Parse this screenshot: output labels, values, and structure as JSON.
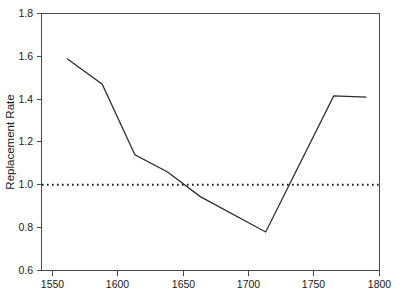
{
  "chart_data": {
    "type": "line",
    "title": "",
    "xlabel": "",
    "ylabel": "Replacement Rate",
    "xlim": [
      1540,
      1800
    ],
    "ylim": [
      0.6,
      1.8
    ],
    "xticks": [
      1550,
      1600,
      1650,
      1700,
      1750,
      1800
    ],
    "xtick_labels": [
      "1550",
      "1600",
      "1650",
      "1700",
      "1750",
      "1800"
    ],
    "yticks": [
      0.6,
      0.8,
      1.0,
      1.2,
      1.4,
      1.6,
      1.8
    ],
    "ytick_labels": [
      "0.6",
      "0.8",
      "1.0",
      "1.2",
      "1.4",
      "1.6",
      "1.8"
    ],
    "grid": false,
    "legend": "none",
    "series": [
      {
        "name": "Replacement Rate",
        "style": "solid",
        "color": "#2b2b2b",
        "x": [
          1561,
          1588,
          1613,
          1638,
          1663,
          1713,
          1765,
          1790
        ],
        "values": [
          1.59,
          1.47,
          1.14,
          1.06,
          0.945,
          0.78,
          1.415,
          1.41
        ]
      },
      {
        "name": "Reference level",
        "style": "dotted",
        "color": "#1a1a1a",
        "x": [
          1540,
          1800
        ],
        "values": [
          1.0,
          1.0
        ]
      }
    ],
    "annotations": []
  },
  "axes": {
    "y_title": "Replacement Rate"
  }
}
